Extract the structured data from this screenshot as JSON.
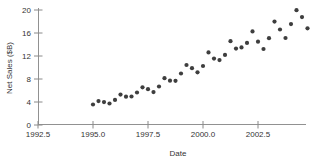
{
  "chart_data": {
    "type": "scatter",
    "title": "",
    "xlabel": "Date",
    "ylabel": "Net Sales ($B)",
    "xlim": [
      1992.5,
      2005.2
    ],
    "ylim": [
      0,
      20.4
    ],
    "grid": false,
    "legend_position": "none",
    "x_ticks": [
      1992.5,
      1995.0,
      1997.5,
      2000.0,
      2002.5
    ],
    "x_tick_labels": [
      "1992.5",
      "1995.0",
      "1997.5",
      "2000.0",
      "2002.5"
    ],
    "y_ticks": [
      0,
      4,
      8,
      12,
      16,
      20
    ],
    "y_tick_labels": [
      "0",
      "4",
      "8",
      "12",
      "16",
      "20"
    ],
    "x": [
      1995.0,
      1995.25,
      1995.5,
      1995.75,
      1996.0,
      1996.25,
      1996.5,
      1996.75,
      1997.0,
      1997.25,
      1997.5,
      1997.75,
      1998.0,
      1998.25,
      1998.5,
      1998.75,
      1999.0,
      1999.25,
      1999.5,
      1999.75,
      2000.0,
      2000.25,
      2000.5,
      2000.75,
      2001.0,
      2001.25,
      2001.5,
      2001.75,
      2002.0,
      2002.25,
      2002.5,
      2002.75,
      2003.0,
      2003.25,
      2003.5,
      2003.75,
      2004.0,
      2004.25,
      2004.5,
      2004.75
    ],
    "y": [
      3.57,
      4.15,
      3.99,
      3.74,
      4.36,
      5.29,
      4.92,
      4.96,
      5.66,
      6.55,
      6.22,
      5.73,
      6.69,
      8.14,
      7.7,
      7.69,
      8.95,
      10.43,
      9.88,
      9.17,
      10.26,
      12.62,
      11.55,
      11.28,
      12.2,
      14.58,
      13.29,
      13.49,
      14.28,
      16.28,
      14.48,
      13.21,
      15.1,
      17.99,
      16.6,
      15.13,
      17.55,
      19.96,
      18.77,
      16.81
    ],
    "colors": {
      "background": "#ffffff",
      "axis": "#919191",
      "tick": "#8a8a8a",
      "text": "#333333",
      "point": "#3e3e3e"
    }
  }
}
